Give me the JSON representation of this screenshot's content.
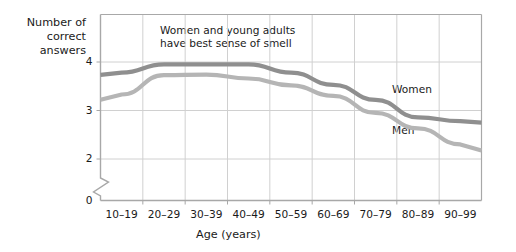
{
  "chart_data": {
    "type": "line",
    "title": "",
    "ylabel": "Number of\ncorrect answers",
    "xlabel": "Age (years)",
    "categories": [
      "10–19",
      "20–29",
      "30–39",
      "40–49",
      "50–59",
      "60–69",
      "70–79",
      "80–89",
      "90–99"
    ],
    "ylim": [
      2,
      4.35
    ],
    "yticks": [
      "4",
      "3",
      "2",
      "0"
    ],
    "ytick_values": [
      4,
      3,
      2,
      0
    ],
    "grid": true,
    "axis_break": true,
    "legend_position": "inline-labels",
    "annotations": [
      {
        "text": "Women and young adults\nhave best sense of smell",
        "x_category": "30–39"
      }
    ],
    "series": [
      {
        "name": "Women",
        "color": "#8f8f8f",
        "values": [
          3.78,
          3.95,
          3.95,
          3.95,
          3.78,
          3.53,
          3.22,
          2.86,
          2.78
        ]
      },
      {
        "name": "Men",
        "color": "#b5b5b5",
        "values": [
          3.33,
          3.73,
          3.74,
          3.66,
          3.52,
          3.3,
          2.95,
          2.63,
          2.3
        ]
      }
    ]
  },
  "labels": {
    "women": "Women",
    "men": "Men",
    "annotation": "Women and young adults\nhave best sense of smell",
    "y_axis_title": "Number of\ncorrect answers",
    "x_axis_title": "Age (years)"
  },
  "colors": {
    "women_line": "#8f8f8f",
    "men_line": "#b5b5b5",
    "grid": "#d0d0d0",
    "axis": "#a8a8a8",
    "text": "#1a1a1a",
    "background": "#ffffff"
  }
}
